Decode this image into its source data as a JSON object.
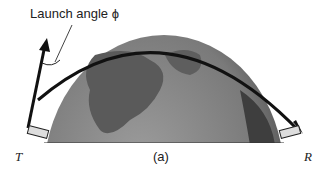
{
  "diagram": {
    "label_launch_angle": "Launch angle ϕ",
    "label_transmitter": "T",
    "label_receiver": "R",
    "caption": "(a)",
    "colors": {
      "earth": "#7a7a7a",
      "earth_dark": "#4e4e4e",
      "earth_light": "#9a9a9a",
      "arc": "#111111"
    }
  }
}
